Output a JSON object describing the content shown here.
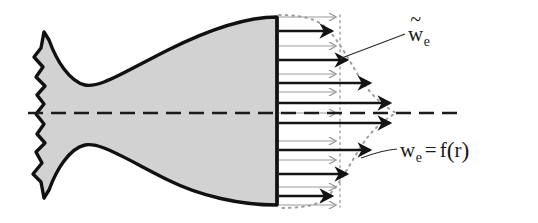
{
  "figure": {
    "background_color": "#ffffff",
    "width": 538,
    "height": 223
  },
  "nozzle": {
    "name": "bell-nozzle-cross-section",
    "fill_color": "#d2d2d2",
    "outline_color": "#111111",
    "outline_width": 3.4,
    "exit_plane_x": 277,
    "exit_plane_top_y": 17,
    "exit_plane_bottom_y": 205,
    "broken_edge_x": 30,
    "description": "Axisymmetric bell nozzle shown in half-section with jagged break line at the chamber end"
  },
  "centerline": {
    "name": "axis-of-symmetry",
    "y": 113,
    "x_start": 28,
    "x_end": 458,
    "color": "#1a1a1a",
    "width": 2.6,
    "dash_pattern": "14 7 14 7"
  },
  "profiles": {
    "uniform": {
      "label_id": "w-tilde",
      "arrow_color": "#9a9a9a",
      "arrow_width": 1.1,
      "tip_x": 340,
      "description": "Uniform (mass-averaged) exit velocity; all thin gray arrows equal length terminating on vertical dotted line"
    },
    "actual": {
      "label_id": "w-func",
      "arrow_color": "#141414",
      "arrow_width": 2.6,
      "max_tip_x": 396,
      "min_tip_x": 314,
      "description": "Actual radially varying exit velocity; thick black arrows whose tips trace the dotted bell-shaped profile curve"
    },
    "dotted_curve_color": "#9e9e9e",
    "dotted_line_color": "#b0b0b0"
  },
  "arrows": {
    "tail_x": 279,
    "thin_rows_y": [
      17,
      46,
      74,
      92,
      113,
      141,
      160,
      187,
      205
    ],
    "thick_rows_y": [
      31,
      60,
      83,
      103,
      123,
      150,
      174,
      196
    ],
    "thick_tip_x": [
      338,
      353,
      376,
      396,
      396,
      376,
      353,
      338
    ]
  },
  "labels": [
    {
      "id": "w-tilde",
      "name": "label-uniform-velocity",
      "base": "w",
      "accent": "~",
      "subscript": "e",
      "text_plain": "w̃e",
      "x": 408,
      "y": 24,
      "leader": {
        "x1": 340,
        "y1": 58,
        "x2": 404,
        "y2": 34
      }
    },
    {
      "id": "w-func",
      "name": "label-actual-velocity",
      "base": "w",
      "subscript": "e",
      "equals": "=",
      "function": "f",
      "open_paren": "(",
      "argument": "r",
      "close_paren": ")",
      "text_plain": "we = f(r)",
      "x": 400,
      "y": 139,
      "leader": {
        "x1": 362,
        "y1": 157,
        "x2": 396,
        "y2": 150
      }
    }
  ]
}
